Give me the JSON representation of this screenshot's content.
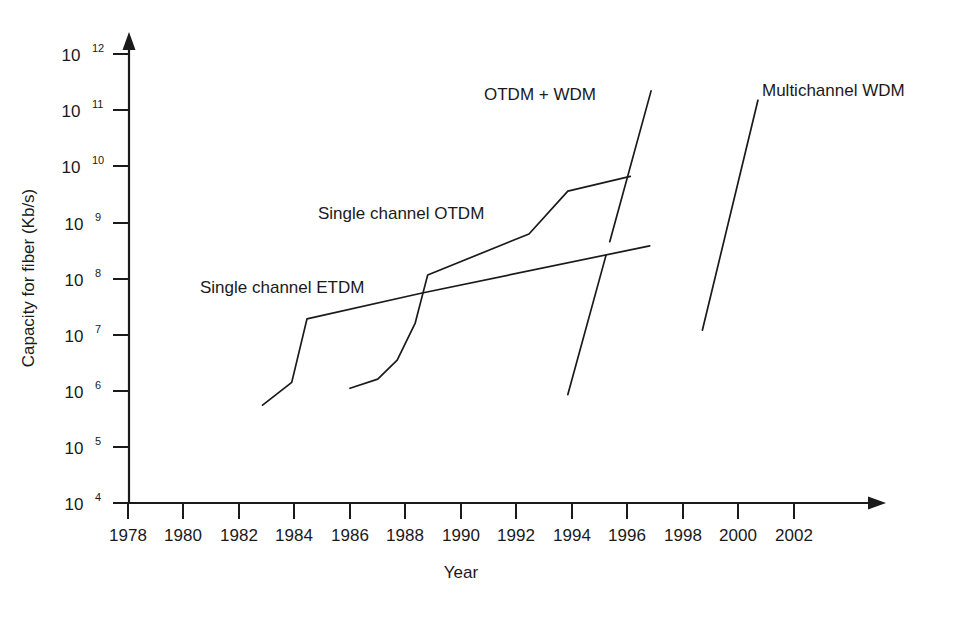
{
  "chart_data": {
    "type": "line",
    "title": "",
    "xlabel": "Year",
    "ylabel": "Capacity for fiber (Kb/s)",
    "xlim": [
      1977,
      2003.5
    ],
    "ylim": [
      10000.0,
      1000000000000.0
    ],
    "yscale": "log",
    "grid": false,
    "legend_position": "inline-annotations",
    "x_ticks": [
      "1978",
      "1980",
      "1982",
      "1984",
      "1986",
      "1988",
      "1990",
      "1992",
      "1994",
      "1996",
      "1998",
      "2000",
      "2002"
    ],
    "x_tick_values": [
      1978,
      1980,
      1982,
      1984,
      1986,
      1988,
      1990,
      1992,
      1994,
      1996,
      1998,
      2000,
      2002
    ],
    "y_ticks": [
      "10^12",
      "10^11",
      "10^10",
      "10^9",
      "10^8",
      "10^7",
      "10^6",
      "10^5",
      "10^4"
    ],
    "y_tick_bases": [
      "10",
      "10",
      "10",
      "10",
      "10",
      "10",
      "10",
      "10",
      "10"
    ],
    "y_tick_exponents": [
      "12",
      "11",
      "10",
      "9",
      "8",
      "7",
      "6",
      "5",
      "4"
    ],
    "y_tick_values": [
      1000000000000.0,
      100000000000.0,
      10000000000.0,
      1000000000.0,
      100000000.0,
      10000000.0,
      1000000.0,
      100000.0,
      10000.0
    ],
    "series": [
      {
        "name": "Single channel ETDM",
        "label": "Single channel ETDM",
        "label_x": 200,
        "label_y": 293,
        "points": [
          {
            "x": 1982.85,
            "y": 550000.0
          },
          {
            "x": 1983.9,
            "y": 1400000.0
          },
          {
            "x": 1984.45,
            "y": 19000000.0
          },
          {
            "x": 1988.6,
            "y": 55000000.0
          },
          {
            "x": 1996.8,
            "y": 380000000.0
          }
        ]
      },
      {
        "name": "Single channel OTDM",
        "label": "Single channel OTDM",
        "label_x": 318,
        "label_y": 219,
        "points": [
          {
            "x": 1986.0,
            "y": 1100000.0
          },
          {
            "x": 1987.0,
            "y": 1600000.0
          },
          {
            "x": 1987.7,
            "y": 3500000.0
          },
          {
            "x": 1988.35,
            "y": 16000000.0
          },
          {
            "x": 1988.65,
            "y": 60000000.0
          },
          {
            "x": 1988.8,
            "y": 115000000.0
          },
          {
            "x": 1992.45,
            "y": 620000000.0
          },
          {
            "x": 1993.85,
            "y": 3600000000.0
          },
          {
            "x": 1996.1,
            "y": 6600000000.0
          }
        ]
      },
      {
        "name": "OTDM + WDM",
        "label": "OTDM  + WDM",
        "label_x": 484,
        "label_y": 100,
        "points": [
          {
            "x": 1993.85,
            "y": 850000.0
          },
          {
            "x": 1996.85,
            "y": 220000000000.0
          }
        ],
        "break_at_y": [
          260000000.0,
          450000000.0
        ]
      },
      {
        "name": "Multichannel WDM",
        "label": "Multichannel WDM",
        "label_x": 762,
        "label_y": 96,
        "points": [
          {
            "x": 1998.7,
            "y": 12000000.0
          },
          {
            "x": 2000.7,
            "y": 150000000000.0
          }
        ]
      }
    ]
  },
  "axes": {
    "x_axis_name": "year-axis",
    "y_axis_name": "capacity-axis"
  }
}
